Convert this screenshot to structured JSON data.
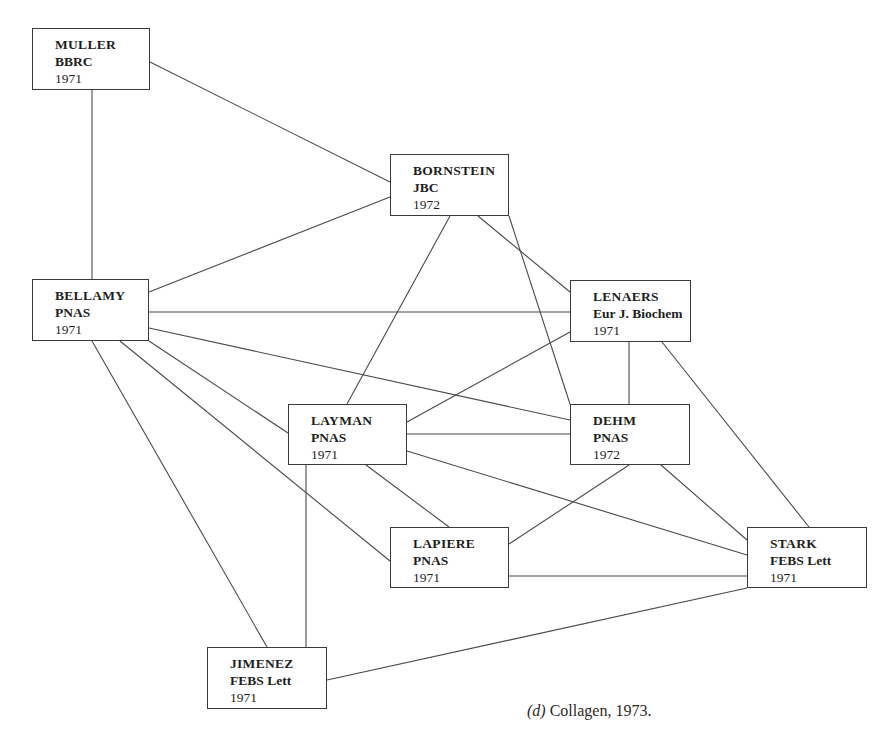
{
  "caption": {
    "label": "(d)",
    "text": "Collagen, 1973."
  },
  "nodes": [
    {
      "id": "muller",
      "author": "MULLER",
      "journal": "BBRC",
      "year": "1971",
      "x": 32,
      "y": 28,
      "w": 118,
      "h": 62
    },
    {
      "id": "bornstein",
      "author": "BORNSTEIN",
      "journal": "JBC",
      "year": "1972",
      "x": 390,
      "y": 154,
      "w": 119,
      "h": 62
    },
    {
      "id": "bellamy",
      "author": "BELLAMY",
      "journal": "PNAS",
      "year": "1971",
      "x": 32,
      "y": 279,
      "w": 117,
      "h": 62
    },
    {
      "id": "lenaers",
      "author": "LENAERS",
      "journal": "Eur J. Biochem",
      "year": "1971",
      "x": 570,
      "y": 280,
      "w": 121,
      "h": 62
    },
    {
      "id": "layman",
      "author": "LAYMAN",
      "journal": "PNAS",
      "year": "1971",
      "x": 288,
      "y": 404,
      "w": 119,
      "h": 61
    },
    {
      "id": "dehm",
      "author": "DEHM",
      "journal": "PNAS",
      "year": "1972",
      "x": 570,
      "y": 404,
      "w": 120,
      "h": 61
    },
    {
      "id": "lapiere",
      "author": "LAPIERE",
      "journal": "PNAS",
      "year": "1971",
      "x": 390,
      "y": 527,
      "w": 119,
      "h": 61
    },
    {
      "id": "stark",
      "author": "STARK",
      "journal": "FEBS Lett",
      "year": "1971",
      "x": 747,
      "y": 527,
      "w": 120,
      "h": 61
    },
    {
      "id": "jimenez",
      "author": "JIMENEZ",
      "journal": "FEBS Lett",
      "year": "1971",
      "x": 207,
      "y": 647,
      "w": 120,
      "h": 62
    }
  ],
  "edges": [
    {
      "from": "muller",
      "to": "bellamy",
      "x1": 92,
      "y1": 90,
      "x2": 92,
      "y2": 279
    },
    {
      "from": "muller",
      "to": "bornstein",
      "x1": 150,
      "y1": 62,
      "x2": 390,
      "y2": 182
    },
    {
      "from": "bornstein",
      "to": "bellamy",
      "x1": 390,
      "y1": 197,
      "x2": 149,
      "y2": 292
    },
    {
      "from": "bornstein",
      "to": "layman",
      "x1": 450,
      "y1": 216,
      "x2": 347,
      "y2": 404
    },
    {
      "from": "bornstein",
      "to": "lenaers",
      "x1": 478,
      "y1": 216,
      "x2": 570,
      "y2": 292
    },
    {
      "from": "bornstein",
      "to": "dehm",
      "x1": 509,
      "y1": 216,
      "x2": 570,
      "y2": 404
    },
    {
      "from": "bellamy",
      "to": "lenaers",
      "x1": 149,
      "y1": 312,
      "x2": 570,
      "y2": 312
    },
    {
      "from": "bellamy",
      "to": "dehm",
      "x1": 149,
      "y1": 328,
      "x2": 570,
      "y2": 420
    },
    {
      "from": "bellamy",
      "to": "layman",
      "x1": 149,
      "y1": 341,
      "x2": 288,
      "y2": 433
    },
    {
      "from": "bellamy",
      "to": "lapiere",
      "x1": 120,
      "y1": 341,
      "x2": 390,
      "y2": 561
    },
    {
      "from": "bellamy",
      "to": "jimenez",
      "x1": 92,
      "y1": 341,
      "x2": 267,
      "y2": 647
    },
    {
      "from": "lenaers",
      "to": "layman",
      "x1": 570,
      "y1": 332,
      "x2": 407,
      "y2": 422
    },
    {
      "from": "lenaers",
      "to": "dehm",
      "x1": 629,
      "y1": 342,
      "x2": 629,
      "y2": 404
    },
    {
      "from": "lenaers",
      "to": "stark",
      "x1": 662,
      "y1": 342,
      "x2": 809,
      "y2": 527
    },
    {
      "from": "layman",
      "to": "dehm",
      "x1": 407,
      "y1": 434,
      "x2": 570,
      "y2": 434
    },
    {
      "from": "layman",
      "to": "stark",
      "x1": 407,
      "y1": 451,
      "x2": 747,
      "y2": 555
    },
    {
      "from": "layman",
      "to": "lapiere",
      "x1": 366,
      "y1": 465,
      "x2": 449,
      "y2": 527
    },
    {
      "from": "layman",
      "to": "jimenez",
      "x1": 306,
      "y1": 465,
      "x2": 306,
      "y2": 647
    },
    {
      "from": "dehm",
      "to": "lapiere",
      "x1": 629,
      "y1": 465,
      "x2": 509,
      "y2": 544
    },
    {
      "from": "dehm",
      "to": "stark",
      "x1": 661,
      "y1": 465,
      "x2": 747,
      "y2": 540
    },
    {
      "from": "lapiere",
      "to": "stark",
      "x1": 509,
      "y1": 576,
      "x2": 747,
      "y2": 576
    },
    {
      "from": "stark",
      "to": "jimenez",
      "x1": 747,
      "y1": 588,
      "x2": 327,
      "y2": 680
    }
  ]
}
